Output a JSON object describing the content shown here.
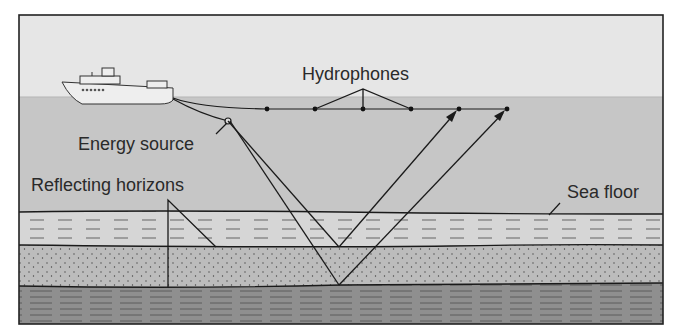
{
  "diagram": {
    "labels": {
      "hydrophones": "Hydrophones",
      "energy_source": "Energy source",
      "reflecting_horizons": "Reflecting horizons",
      "sea_floor": "Sea floor"
    },
    "components": {
      "ship": "survey-ship",
      "streamer": "hydrophone streamer cable",
      "hydrophone_count": 6,
      "layers": [
        "sky",
        "sea water",
        "dashed sediment layer",
        "dotted sand layer",
        "dark striped bedrock layer"
      ]
    },
    "colors": {
      "sky": "#e6e6e6",
      "water": "#c9c9c9",
      "layer1": "#d8d8d8",
      "layer2": "#b9b9b9",
      "layer3": "#8e8e8e",
      "lines": "#1a1a1a"
    }
  }
}
